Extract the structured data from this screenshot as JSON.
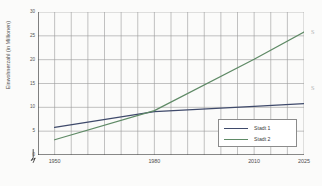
{
  "chart_data": {
    "type": "line",
    "title": "",
    "xlabel": "",
    "ylabel": "Einwohnerzahl (in Millionen)",
    "xlim": [
      1945,
      2025
    ],
    "ylim": [
      0,
      30
    ],
    "xticks": [
      1950,
      1980,
      2010,
      2025
    ],
    "xtick_labels": [
      "1950",
      "1980",
      "2010",
      "2025"
    ],
    "yticks": [
      0,
      5,
      10,
      15,
      20,
      25,
      30
    ],
    "ytick_labels": [
      "0",
      "5",
      "10",
      "15",
      "20",
      "25",
      "30"
    ],
    "grid": true,
    "grid_x_interval": 5,
    "grid_y_interval": 5,
    "y_axis_break": true,
    "legend_position": "bottom-right",
    "series": [
      {
        "name": "Stadt 1",
        "color": "#3f4a6b",
        "x": [
          1950,
          1980,
          2010,
          2025
        ],
        "values": [
          5.8,
          9.1,
          10.2,
          10.8
        ]
      },
      {
        "name": "Stadt 2",
        "color": "#5f8a66",
        "x": [
          1950,
          1980,
          2010,
          2025
        ],
        "values": [
          3.2,
          9.3,
          20.1,
          25.8
        ]
      }
    ]
  },
  "legend": {
    "items": [
      {
        "label": "Stadt 1",
        "color": "#3f4a6b"
      },
      {
        "label": "Stadt 2",
        "color": "#5f8a66"
      }
    ]
  },
  "edge_marks": {
    "upper": "s",
    "lower": "s"
  }
}
